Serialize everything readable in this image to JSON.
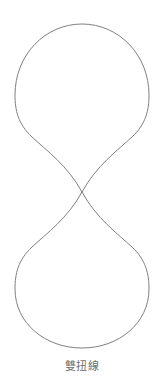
{
  "figure": {
    "caption": "雙扭線",
    "background_color": "#ffffff",
    "stroke_color": "#808080",
    "caption_color": "#6e6e6e",
    "stroke_width": 1
  },
  "chart_data": {
    "type": "line",
    "title": "雙扭線",
    "xlabel": "",
    "ylabel": "",
    "grid": false,
    "legend": null,
    "curve_name": "lemniscate",
    "orientation": "vertical",
    "crossing_point": {
      "x": 82,
      "y": 192
    },
    "top_apex": {
      "x": 82,
      "y": 24
    },
    "bottom_apex": {
      "x": 82,
      "y": 348
    },
    "left_extent": 16,
    "right_extent": 148,
    "top_lobe_widest_y": 92,
    "bottom_lobe_widest_y": 279,
    "xlim": [
      16,
      148
    ],
    "ylim": [
      24,
      348
    ],
    "path": "M 82 192 C 96 166 118 150 132 137 C 146 124 149 110 149 95 C 149 55 119 24 82 24 C 45 24 15 55 15 95 C 15 110 18 124 32 137 C 46 150 68 166 82 192 C 96 218 118 234 132 247 C 146 260 149 274 149 289 C 149 323 119 348 82 348 C 45 348 15 323 15 289 C 15 274 18 260 32 247 C 46 234 68 218 82 192 Z"
  }
}
